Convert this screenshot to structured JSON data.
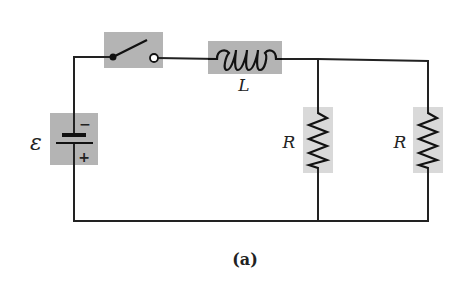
{
  "diagram": {
    "type": "RL circuit schematic",
    "caption": "(a)",
    "colors": {
      "wire": "#222222",
      "component_highlight": "#b4b4b4",
      "resistor_highlight": "#d9d9d9",
      "background": "#ffffff"
    },
    "components": {
      "battery": {
        "label": "ε",
        "negative_sign": "−",
        "positive_sign": "+"
      },
      "switch": {
        "state": "open"
      },
      "inductor": {
        "label": "L"
      },
      "resistor_1": {
        "label": "R"
      },
      "resistor_2": {
        "label": "R"
      }
    }
  }
}
